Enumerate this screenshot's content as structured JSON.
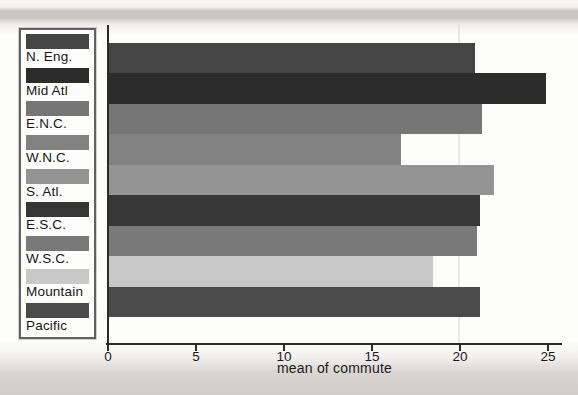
{
  "chart_data": {
    "type": "bar",
    "orientation": "horizontal",
    "title": "",
    "xlabel": "mean of commute",
    "ylabel": "",
    "categories": [
      "N. Eng.",
      "Mid Atl",
      "E.N.C.",
      "W.N.C.",
      "S. Atl.",
      "E.S.C.",
      "W.S.C.",
      "Mountain",
      "Pacific"
    ],
    "values": [
      20.8,
      24.8,
      21.2,
      16.6,
      21.9,
      21.1,
      20.9,
      18.4,
      21.1
    ],
    "colors": [
      "#454545",
      "#2c2c2c",
      "#767676",
      "#828282",
      "#949494",
      "#363636",
      "#797979",
      "#c8c8c8",
      "#4b4b4b"
    ],
    "xticks": [
      0,
      5,
      10,
      15,
      20,
      25
    ],
    "xlim": [
      0,
      25.8
    ],
    "grid": false,
    "legend_position": "left",
    "axis_color": "#2a2a2a"
  }
}
